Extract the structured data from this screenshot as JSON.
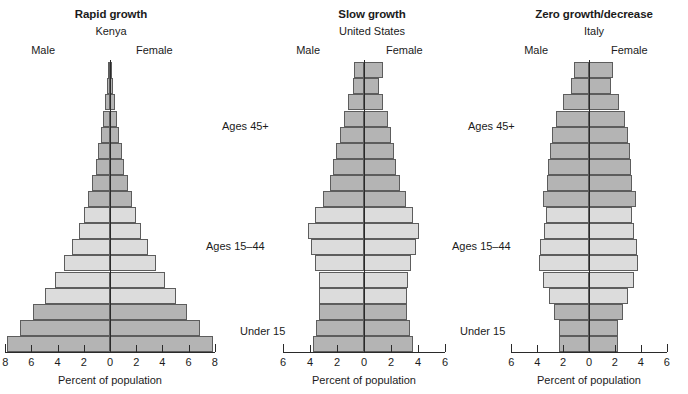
{
  "figure": {
    "axis_title": "Percent of population",
    "male_label": "Male",
    "female_label": "Female",
    "age_band_labels": {
      "top": "Ages 45+",
      "middle": "Ages 15–44",
      "bottom": "Under 15"
    },
    "colors": {
      "dark_band": "#b4b4b4",
      "light_band": "#dcdcdc",
      "outline": "#5d5d5d",
      "axis": "#2a2a2a",
      "background": "#ffffff"
    }
  },
  "chart_data": [
    {
      "type": "bar",
      "title": "Rapid growth",
      "subtitle": "Kenya",
      "xlabel": "Percent of population",
      "ylabel": "",
      "xlim": [
        -8,
        8
      ],
      "xticks": [
        8,
        6,
        4,
        2,
        0,
        2,
        4,
        6,
        8
      ],
      "grid": false,
      "legend": "none",
      "categories": [
        "0–4",
        "5–9",
        "10–14",
        "15–19",
        "20–24",
        "25–29",
        "30–34",
        "35–39",
        "40–44",
        "45–49",
        "50–54",
        "55–59",
        "60–64",
        "65–69",
        "70–74",
        "75–79",
        "80–84",
        "85+"
      ],
      "band_of_category": [
        "Under 15",
        "Under 15",
        "Under 15",
        "Ages 15–44",
        "Ages 15–44",
        "Ages 15–44",
        "Ages 15–44",
        "Ages 15–44",
        "Ages 15–44",
        "Ages 45+",
        "Ages 45+",
        "Ages 45+",
        "Ages 45+",
        "Ages 45+",
        "Ages 45+",
        "Ages 45+",
        "Ages 45+",
        "Ages 45+"
      ],
      "series": [
        {
          "name": "Male",
          "values": [
            7.9,
            6.9,
            5.9,
            5.0,
            4.2,
            3.5,
            2.9,
            2.4,
            2.0,
            1.65,
            1.35,
            1.1,
            0.9,
            0.7,
            0.52,
            0.36,
            0.22,
            0.14
          ]
        },
        {
          "name": "Female",
          "values": [
            7.9,
            6.9,
            5.9,
            5.0,
            4.2,
            3.5,
            2.9,
            2.4,
            2.0,
            1.65,
            1.35,
            1.1,
            0.9,
            0.7,
            0.52,
            0.36,
            0.22,
            0.14
          ]
        }
      ]
    },
    {
      "type": "bar",
      "title": "Slow growth",
      "subtitle": "United States",
      "xlabel": "Percent of population",
      "ylabel": "",
      "xlim": [
        -6,
        6
      ],
      "xticks": [
        6,
        4,
        2,
        0,
        2,
        4,
        6
      ],
      "grid": false,
      "legend": "none",
      "categories": [
        "0–4",
        "5–9",
        "10–14",
        "15–19",
        "20–24",
        "25–29",
        "30–34",
        "35–39",
        "40–44",
        "45–49",
        "50–54",
        "55–59",
        "60–64",
        "65–69",
        "70–74",
        "75–79",
        "80–84",
        "85+"
      ],
      "band_of_category": [
        "Under 15",
        "Under 15",
        "Under 15",
        "Ages 15–44",
        "Ages 15–44",
        "Ages 15–44",
        "Ages 15–44",
        "Ages 15–44",
        "Ages 15–44",
        "Ages 45+",
        "Ages 45+",
        "Ages 45+",
        "Ages 45+",
        "Ages 45+",
        "Ages 45+",
        "Ages 45+",
        "Ages 45+",
        "Ages 45+"
      ],
      "series": [
        {
          "name": "Male",
          "values": [
            3.8,
            3.55,
            3.35,
            3.3,
            3.35,
            3.6,
            3.95,
            4.15,
            3.6,
            3.05,
            2.55,
            2.3,
            2.05,
            1.8,
            1.5,
            1.15,
            0.8,
            0.75
          ]
        },
        {
          "name": "Female",
          "values": [
            3.6,
            3.4,
            3.2,
            3.15,
            3.25,
            3.5,
            3.85,
            4.1,
            3.6,
            3.1,
            2.65,
            2.4,
            2.2,
            2.0,
            1.75,
            1.4,
            1.1,
            1.4
          ]
        }
      ]
    },
    {
      "type": "bar",
      "title": "Zero growth/decrease",
      "subtitle": "Italy",
      "xlabel": "Percent of population",
      "ylabel": "",
      "xlim": [
        -6,
        6
      ],
      "xticks": [
        6,
        4,
        2,
        0,
        2,
        4,
        6
      ],
      "grid": false,
      "legend": "none",
      "categories": [
        "0–4",
        "5–9",
        "10–14",
        "15–19",
        "20–24",
        "25–29",
        "30–34",
        "35–39",
        "40–44",
        "45–49",
        "50–54",
        "55–59",
        "60–64",
        "65–69",
        "70–74",
        "75–79",
        "80–84",
        "85+"
      ],
      "band_of_category": [
        "Under 15",
        "Under 15",
        "Under 15",
        "Ages 15–44",
        "Ages 15–44",
        "Ages 15–44",
        "Ages 15–44",
        "Ages 15–44",
        "Ages 15–44",
        "Ages 45+",
        "Ages 45+",
        "Ages 45+",
        "Ages 45+",
        "Ages 45+",
        "Ages 45+",
        "Ages 45+",
        "Ages 45+",
        "Ages 45+"
      ],
      "series": [
        {
          "name": "Male",
          "values": [
            2.35,
            2.35,
            2.7,
            3.1,
            3.55,
            3.85,
            3.75,
            3.5,
            3.35,
            3.55,
            3.25,
            3.15,
            3.0,
            2.85,
            2.55,
            2.0,
            1.4,
            1.15
          ]
        },
        {
          "name": "Female",
          "values": [
            2.25,
            2.25,
            2.6,
            3.0,
            3.45,
            3.75,
            3.7,
            3.5,
            3.35,
            3.6,
            3.35,
            3.25,
            3.15,
            3.05,
            2.8,
            2.3,
            1.7,
            1.85
          ]
        }
      ]
    }
  ],
  "panels": [
    {
      "id": "kenya",
      "left": 0,
      "width": 222,
      "center_x": 110,
      "unit_px": 13.1,
      "male_label_x": 55,
      "female_label_x": 136,
      "age_labels": [
        {
          "key": "top",
          "x": 222,
          "y": 120
        },
        {
          "key": "middle",
          "x": 206,
          "y": 240
        },
        {
          "key": "bottom",
          "x": 240,
          "y": 325
        }
      ]
    },
    {
      "id": "united-states",
      "left": 276,
      "width": 192,
      "center_x": 364,
      "unit_px": 13.5,
      "male_label_x": 320,
      "female_label_x": 386,
      "age_labels": [
        {
          "key": "top",
          "x": 468,
          "y": 120
        },
        {
          "key": "middle",
          "x": 452,
          "y": 240
        },
        {
          "key": "bottom",
          "x": 460,
          "y": 325
        }
      ]
    },
    {
      "id": "italy",
      "left": 500,
      "width": 188,
      "center_x": 589,
      "unit_px": 12.95,
      "male_label_x": 548,
      "female_label_x": 611,
      "age_labels": []
    }
  ]
}
